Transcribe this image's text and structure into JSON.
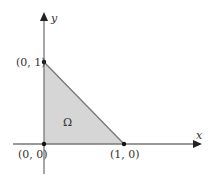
{
  "diagram": {
    "type": "region-diagram",
    "axes": {
      "x_label": "x",
      "y_label": "y"
    },
    "region": {
      "label": "Ω",
      "fill": "#d6d6d6",
      "edge": "#777777",
      "vertices": [
        [
          0,
          0
        ],
        [
          1,
          0
        ],
        [
          0,
          1
        ]
      ]
    },
    "points": [
      {
        "label": "(0, 0)",
        "x": 0,
        "y": 0
      },
      {
        "label": "(1, 0)",
        "x": 1,
        "y": 0
      },
      {
        "label": "(0, 1)",
        "x": 0,
        "y": 1
      }
    ]
  }
}
